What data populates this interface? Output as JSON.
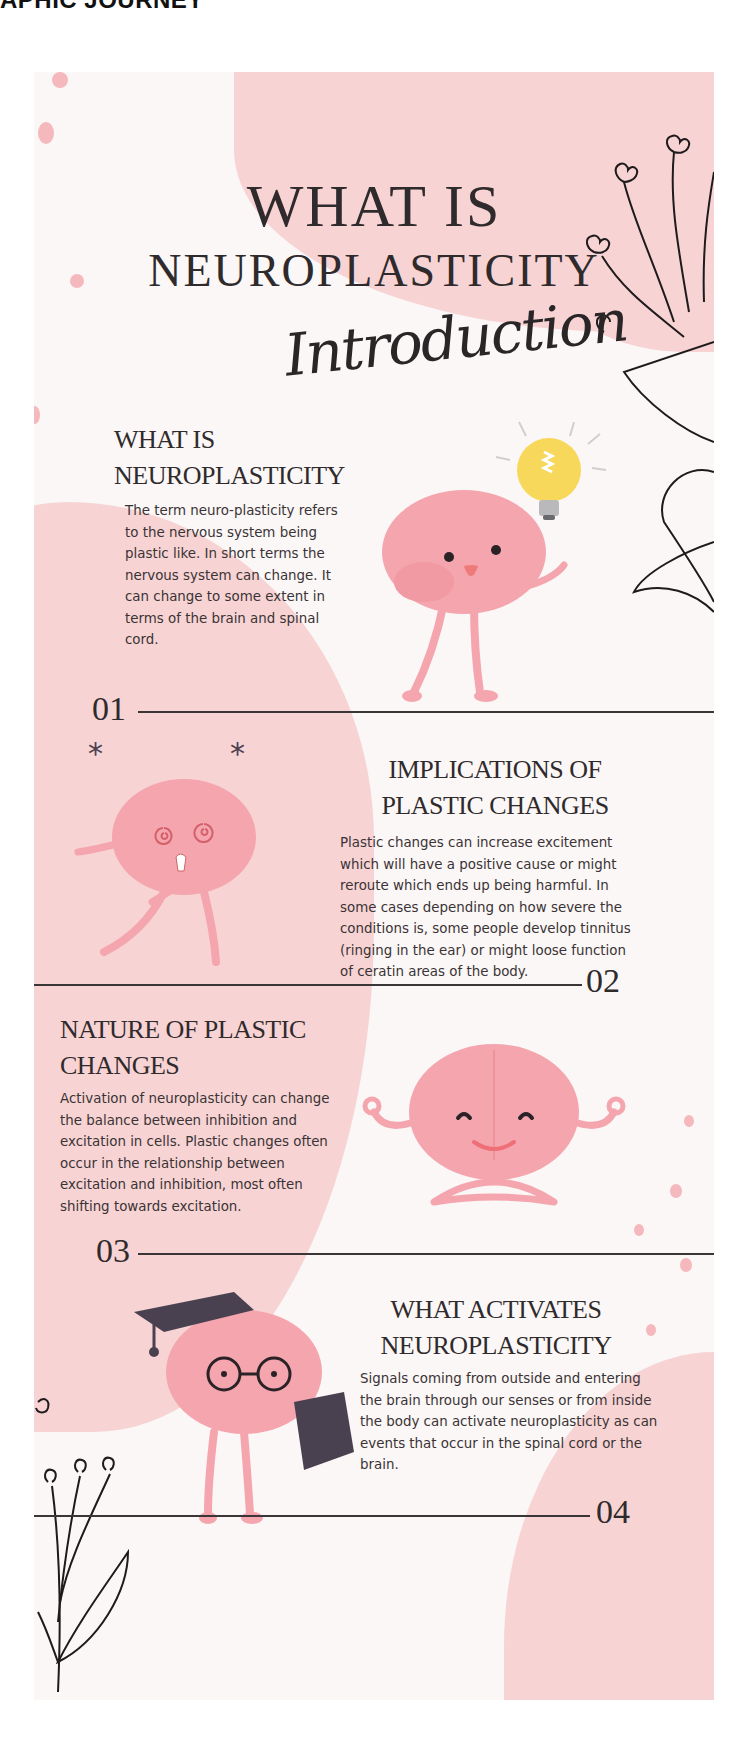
{
  "header": {
    "cut_text": "APHIC JOURNEY"
  },
  "title": {
    "line1": "WHAT IS",
    "line2": "NEUROPLASTICITY",
    "script": "Introduction"
  },
  "sections": [
    {
      "number": "01",
      "title_line1": "WHAT IS",
      "title_line2": "NEUROPLASTICITY",
      "body": "The term neuro-plasticity refers to the nervous system being plastic like. In short terms the nervous system can change. It can change to some extent in terms of the brain and spinal cord.",
      "illustration": "brain-with-lightbulb"
    },
    {
      "number": "02",
      "title_line1": "IMPLICATIONS OF",
      "title_line2": "PLASTIC CHANGES",
      "body": "Plastic changes can increase excitement which will have a positive cause or might reroute which ends up being harmful. In some cases depending on how severe the conditions is, some people develop tinnitus (ringing in the ear) or might loose function of ceratin areas of the body.",
      "illustration": "dizzy-brain"
    },
    {
      "number": "03",
      "title_line1": "NATURE OF PLASTIC",
      "title_line2": "CHANGES",
      "body": "Activation of neuroplasticity can change the balance between inhibition and excitation in cells. Plastic changes often occur in the relationship between excitation and inhibition, most often shifting towards excitation.",
      "illustration": "meditating-brain"
    },
    {
      "number": "04",
      "title_line1": "WHAT ACTIVATES",
      "title_line2": "NEUROPLASTICITY",
      "body": "Signals coming from outside and entering the brain through our senses or from inside the body can activate neuroplasticity as can events that occur in the spinal cord or the brain.",
      "illustration": "graduate-brain-with-book"
    }
  ],
  "colors": {
    "background": "#fbf7f6",
    "blob_pink": "#f7d3d4",
    "brain_pink": "#f4a5ad",
    "text_dark": "#2f2a2c",
    "bulb_yellow": "#f8d85a"
  }
}
